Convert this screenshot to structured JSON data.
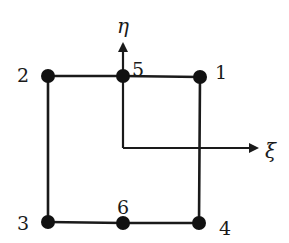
{
  "diagram": {
    "type": "finite-element",
    "colors": {
      "line": "#1a1a1a",
      "node": "#111111",
      "background": "#ffffff"
    },
    "axes": {
      "xi": {
        "label": "ξ",
        "direction": "right"
      },
      "eta": {
        "label": "η",
        "direction": "up"
      }
    },
    "nodes": [
      {
        "id": "1",
        "label": "1",
        "position": "top-right"
      },
      {
        "id": "2",
        "label": "2",
        "position": "top-left"
      },
      {
        "id": "3",
        "label": "3",
        "position": "bottom-left"
      },
      {
        "id": "4",
        "label": "4",
        "position": "bottom-right"
      },
      {
        "id": "5",
        "label": "5",
        "position": "top-middle"
      },
      {
        "id": "6",
        "label": "6",
        "position": "bottom-middle"
      }
    ],
    "edges": [
      {
        "from": "2",
        "to": "5"
      },
      {
        "from": "5",
        "to": "1"
      },
      {
        "from": "1",
        "to": "4"
      },
      {
        "from": "4",
        "to": "6"
      },
      {
        "from": "6",
        "to": "3"
      },
      {
        "from": "3",
        "to": "2"
      }
    ]
  }
}
